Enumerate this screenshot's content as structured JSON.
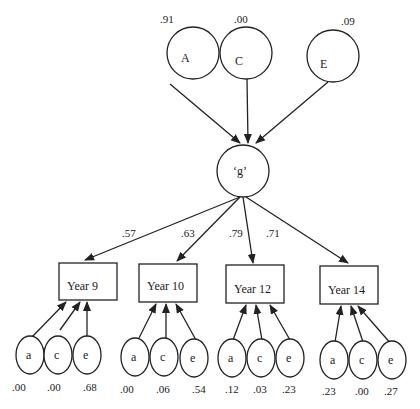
{
  "diagram": {
    "type": "path-diagram",
    "top_factors": [
      {
        "id": "A",
        "label": "A",
        "value": ".91"
      },
      {
        "id": "C",
        "label": "C",
        "value": ".00"
      },
      {
        "id": "E",
        "label": "E",
        "value": ".09"
      }
    ],
    "general_factor": {
      "id": "g",
      "label": "‘g’"
    },
    "loadings": [
      {
        "to": "Year 9",
        "value": ".57"
      },
      {
        "to": "Year 10",
        "value": ".63"
      },
      {
        "to": "Year 12",
        "value": ".79"
      },
      {
        "to": "Year 14",
        "value": ".71"
      }
    ],
    "observed": [
      {
        "label": "Year 9",
        "residuals": [
          {
            "label": "a",
            "value": ".00"
          },
          {
            "label": "c",
            "value": ".00"
          },
          {
            "label": "e",
            "value": ".68"
          }
        ]
      },
      {
        "label": "Year 10",
        "residuals": [
          {
            "label": "a",
            "value": ".00"
          },
          {
            "label": "c",
            "value": ".06"
          },
          {
            "label": "e",
            "value": ".54"
          }
        ]
      },
      {
        "label": "Year 12",
        "residuals": [
          {
            "label": "a",
            "value": ".12"
          },
          {
            "label": "c",
            "value": ".03"
          },
          {
            "label": "e",
            "value": ".23"
          }
        ]
      },
      {
        "label": "Year 14",
        "residuals": [
          {
            "label": "a",
            "value": ".23"
          },
          {
            "label": "c",
            "value": ".00"
          },
          {
            "label": "e",
            "value": ".27"
          }
        ]
      }
    ]
  }
}
